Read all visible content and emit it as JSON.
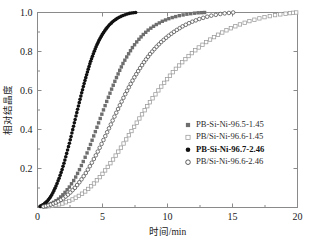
{
  "chart_data": {
    "type": "scatter",
    "title": "",
    "xlabel": "时间/min",
    "ylabel": "相对结晶度",
    "xlim": [
      0,
      20
    ],
    "ylim": [
      0,
      1.0
    ],
    "xticks": [
      "0",
      "5",
      "10",
      "15",
      "20"
    ],
    "xtick_values": [
      0,
      5,
      10,
      15,
      20
    ],
    "yticks": [
      "0.2",
      "0.4",
      "0.6",
      "0.8",
      "1.0"
    ],
    "ytick_values": [
      0.2,
      0.4,
      0.6,
      0.8,
      1.0
    ],
    "grid": false,
    "legend_position": "center-right",
    "series": [
      {
        "name": "PB-Si-Ni-96.5-1.45",
        "marker": "filled-square",
        "color": "#6e6e6e",
        "x": [
          0.3,
          0.75,
          1.2,
          1.65,
          2.05,
          2.45,
          2.85,
          3.2,
          3.55,
          3.9,
          4.2,
          4.5,
          4.8,
          5.1,
          5.4,
          5.7,
          6.0,
          6.3,
          6.6,
          6.95,
          7.3,
          7.7,
          8.1,
          8.55,
          9.05,
          9.6,
          10.2,
          10.85,
          11.55,
          12.25,
          12.85
        ],
        "y": [
          0.005,
          0.012,
          0.025,
          0.045,
          0.072,
          0.105,
          0.145,
          0.19,
          0.24,
          0.293,
          0.345,
          0.398,
          0.452,
          0.505,
          0.557,
          0.607,
          0.655,
          0.7,
          0.742,
          0.782,
          0.82,
          0.855,
          0.885,
          0.912,
          0.935,
          0.955,
          0.971,
          0.983,
          0.992,
          0.998,
          1.0
        ]
      },
      {
        "name": "PB/Si-Ni-96.6-1.45",
        "marker": "open-square",
        "color": "#9a9a9a",
        "x": [
          0.6,
          1.25,
          1.9,
          2.55,
          3.15,
          3.75,
          4.3,
          4.85,
          5.35,
          5.85,
          6.35,
          6.85,
          7.35,
          7.85,
          8.35,
          8.85,
          9.4,
          9.95,
          10.5,
          11.1,
          11.7,
          12.35,
          13.05,
          13.8,
          14.6,
          15.45,
          16.35,
          17.3,
          18.3,
          19.3,
          19.9
        ],
        "y": [
          0.004,
          0.01,
          0.02,
          0.036,
          0.058,
          0.086,
          0.12,
          0.16,
          0.203,
          0.25,
          0.3,
          0.352,
          0.405,
          0.458,
          0.51,
          0.56,
          0.61,
          0.657,
          0.701,
          0.743,
          0.782,
          0.818,
          0.852,
          0.883,
          0.911,
          0.936,
          0.957,
          0.974,
          0.987,
          0.996,
          1.0
        ]
      },
      {
        "name": "PB-Si-Ni-96.7-2.46",
        "marker": "filled-circle",
        "color": "#111111",
        "x": [
          0.2,
          0.45,
          0.72,
          0.98,
          1.22,
          1.45,
          1.68,
          1.9,
          2.1,
          2.3,
          2.5,
          2.68,
          2.86,
          3.04,
          3.22,
          3.4,
          3.58,
          3.76,
          3.94,
          4.12,
          4.32,
          4.52,
          4.74,
          4.98,
          5.24,
          5.52,
          5.84,
          6.2,
          6.62,
          7.1,
          7.55
        ],
        "y": [
          0.006,
          0.015,
          0.03,
          0.052,
          0.08,
          0.114,
          0.153,
          0.196,
          0.242,
          0.291,
          0.341,
          0.391,
          0.441,
          0.491,
          0.54,
          0.588,
          0.634,
          0.677,
          0.718,
          0.756,
          0.793,
          0.827,
          0.858,
          0.887,
          0.913,
          0.936,
          0.956,
          0.973,
          0.986,
          0.996,
          1.0
        ]
      },
      {
        "name": "PB/Si-Ni-96.6-2.46",
        "marker": "open-circle",
        "color": "#4a4a4a",
        "x": [
          0.45,
          0.95,
          1.45,
          1.95,
          2.42,
          2.88,
          3.32,
          3.75,
          4.15,
          4.55,
          4.93,
          5.3,
          5.67,
          6.03,
          6.39,
          6.75,
          7.11,
          7.48,
          7.86,
          8.25,
          8.66,
          9.09,
          9.55,
          10.05,
          10.58,
          11.16,
          11.8,
          12.5,
          13.3,
          14.2,
          15.05
        ],
        "y": [
          0.005,
          0.013,
          0.026,
          0.045,
          0.07,
          0.101,
          0.138,
          0.18,
          0.226,
          0.275,
          0.326,
          0.378,
          0.43,
          0.482,
          0.532,
          0.581,
          0.627,
          0.671,
          0.712,
          0.751,
          0.787,
          0.82,
          0.851,
          0.879,
          0.905,
          0.929,
          0.95,
          0.968,
          0.983,
          0.994,
          1.0
        ]
      }
    ]
  },
  "legend": {
    "items": [
      {
        "label": "PB-Si-Ni-96.5-1.45",
        "marker": "filled-square",
        "color": "#6e6e6e",
        "bold": false
      },
      {
        "label": "PB/Si-Ni-96.6-1.45",
        "marker": "open-square",
        "color": "#9a9a9a",
        "bold": false
      },
      {
        "label": "PB-Si-Ni-96.7-2.46",
        "marker": "filled-circle",
        "color": "#111111",
        "bold": true
      },
      {
        "label": "PB/Si-Ni-96.6-2.46",
        "marker": "open-circle",
        "color": "#2b2b2b",
        "bold": false
      }
    ]
  }
}
